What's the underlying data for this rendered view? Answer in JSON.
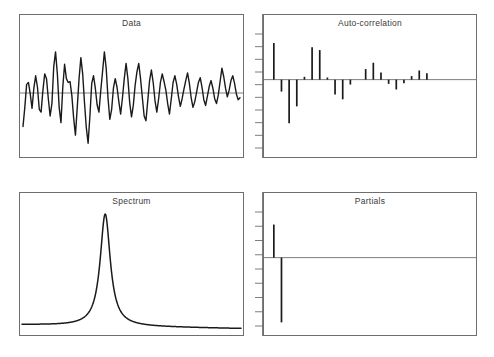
{
  "figure": {
    "background_color": "#ffffff",
    "frame_color": "#6e6e6e",
    "ink_color": "#1a1a1a",
    "title_color": "#3a3a3a",
    "panel_count": 4
  },
  "panels": [
    {
      "id": "data",
      "title": "Data"
    },
    {
      "id": "autocorr",
      "title": "Auto-correlation"
    },
    {
      "id": "spectrum",
      "title": "Spectrum"
    },
    {
      "id": "partials",
      "title": "Partials"
    }
  ],
  "chart_data": [
    {
      "type": "line",
      "id": "data",
      "title": "Data",
      "xlabel": "",
      "ylabel": "",
      "grid": false,
      "legend": "none",
      "zero_line": true,
      "xlim": [
        0,
        120
      ],
      "ylim": [
        -1.15,
        1.15
      ],
      "description": "Noisy quasi-periodic oscillating time series with a horizontal zero reference line; amplitude largest near the start and decaying toward the right.",
      "x": [
        0,
        1,
        2,
        3,
        4,
        5,
        6,
        7,
        8,
        9,
        10,
        11,
        12,
        13,
        14,
        15,
        16,
        17,
        18,
        19,
        20,
        21,
        22,
        23,
        24,
        25,
        26,
        27,
        28,
        29,
        30,
        31,
        32,
        33,
        34,
        35,
        36,
        37,
        38,
        39,
        40,
        41,
        42,
        43,
        44,
        45,
        46,
        47,
        48,
        49,
        50,
        51,
        52,
        53,
        54,
        55,
        56,
        57,
        58,
        59,
        60,
        61,
        62,
        63,
        64,
        65,
        66,
        67,
        68,
        69,
        70,
        71,
        72,
        73,
        74,
        75,
        76,
        77,
        78,
        79,
        80,
        81,
        82,
        83,
        84,
        85,
        86,
        87,
        88,
        89,
        90,
        91,
        92,
        93,
        94,
        95,
        96,
        97,
        98,
        99,
        100,
        101,
        102,
        103,
        104,
        105,
        106,
        107,
        108,
        109,
        110,
        111,
        112,
        113,
        114,
        115,
        116,
        117,
        118,
        119,
        120
      ],
      "values": [
        -0.7,
        -0.3,
        0.18,
        0.22,
        -0.02,
        -0.32,
        0.1,
        0.36,
        0.12,
        -0.34,
        -0.4,
        0.05,
        0.4,
        0.3,
        -0.12,
        -0.48,
        -0.22,
        0.55,
        0.86,
        0.4,
        -0.3,
        -0.62,
        0.12,
        0.6,
        0.3,
        0.22,
        0.24,
        -0.05,
        -0.52,
        -0.88,
        -0.3,
        0.3,
        0.74,
        0.4,
        -0.2,
        -0.72,
        -1.05,
        -0.48,
        0.2,
        0.36,
        0.1,
        -0.25,
        -0.4,
        0.05,
        0.45,
        0.86,
        0.52,
        -0.1,
        -0.55,
        -0.35,
        0.1,
        0.3,
        0.12,
        -0.18,
        -0.44,
        -0.1,
        0.3,
        0.62,
        0.3,
        -0.2,
        -0.5,
        -0.26,
        0.16,
        0.44,
        0.62,
        0.3,
        -0.1,
        -0.48,
        -0.58,
        -0.16,
        0.26,
        0.48,
        0.22,
        -0.16,
        -0.4,
        -0.12,
        0.22,
        0.4,
        0.24,
        0.06,
        -0.22,
        -0.44,
        -0.12,
        0.22,
        0.36,
        0.18,
        -0.08,
        -0.28,
        -0.12,
        0.08,
        0.26,
        0.42,
        0.2,
        -0.1,
        -0.3,
        -0.18,
        0.02,
        0.22,
        0.32,
        0.12,
        -0.14,
        -0.26,
        -0.06,
        0.14,
        0.26,
        0.1,
        -0.12,
        -0.22,
        -0.04,
        0.24,
        0.52,
        0.34,
        0.1,
        -0.08,
        0.06,
        0.26,
        0.36,
        0.2,
        -0.02,
        -0.14,
        -0.1
      ]
    },
    {
      "type": "bar",
      "id": "autocorr",
      "title": "Auto-correlation",
      "xlabel": "",
      "ylabel": "",
      "grid": false,
      "legend": "none",
      "zero_line": true,
      "axis_ticks": 10,
      "ylim": [
        -1.0,
        0.62
      ],
      "description": "Stem/spike correlogram of autocorrelation coefficients by lag, with a tick-marked vertical axis outside the left frame; first lag strongly positive, lags 3-4 strongly negative, then decaying oscillation.",
      "categories": [
        1,
        2,
        3,
        4,
        5,
        6,
        7,
        8,
        9,
        10,
        11,
        12,
        13,
        14,
        15,
        16,
        17,
        18,
        19,
        20,
        21,
        22,
        23,
        24,
        25,
        26
      ],
      "values": [
        0.52,
        -0.17,
        -0.62,
        -0.38,
        0.04,
        0.46,
        0.42,
        0.03,
        -0.21,
        -0.28,
        -0.07,
        0.0,
        0.15,
        0.24,
        0.1,
        -0.06,
        -0.14,
        -0.05,
        0.05,
        0.13,
        0.09,
        0.0,
        0.0,
        0.0,
        0.0,
        0.0
      ]
    },
    {
      "type": "line",
      "id": "spectrum",
      "title": "Spectrum",
      "xlabel": "",
      "ylabel": "",
      "grid": false,
      "legend": "none",
      "zero_line": false,
      "xlim": [
        0,
        1
      ],
      "ylim": [
        0,
        1
      ],
      "description": "Power spectrum with a single tall, very narrow Lorentzian peak at roughly 38% of the frequency axis, rising from a low flat baseline and decaying to near zero on the right.",
      "peak_position": 0.38,
      "peak_height": 1.0,
      "peak_halfwidth": 0.028,
      "baseline_left": 0.045,
      "baseline_right": 0.012
    },
    {
      "type": "bar",
      "id": "partials",
      "title": "Partials",
      "xlabel": "",
      "ylabel": "",
      "grid": false,
      "legend": "none",
      "zero_line": true,
      "axis_ticks": 9,
      "ylim": [
        -1.0,
        0.62
      ],
      "description": "Partial autocorrelation spikes: only the first two lags are non-zero; lag 1 is positive, lag 2 is a much larger negative spike; all remaining lags are zero.",
      "categories": [
        1,
        2,
        3,
        4,
        5,
        6,
        7,
        8,
        9,
        10,
        11,
        12,
        13,
        14,
        15,
        16,
        17,
        18,
        19,
        20,
        21,
        22,
        23,
        24,
        25,
        26
      ],
      "values": [
        0.47,
        -0.92,
        0,
        0,
        0,
        0,
        0,
        0,
        0,
        0,
        0,
        0,
        0,
        0,
        0,
        0,
        0,
        0,
        0,
        0,
        0,
        0,
        0,
        0,
        0,
        0
      ]
    }
  ]
}
